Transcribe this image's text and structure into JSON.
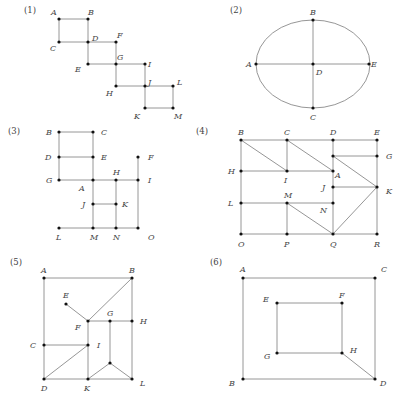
{
  "figures": [
    {
      "label": "(1)",
      "label_pos": [
        24,
        13
      ],
      "points": {
        "A": {
          "x": 59,
          "y": 19,
          "lx": 51,
          "ly": 15
        },
        "B": {
          "x": 88,
          "y": 19,
          "lx": 88,
          "ly": 15
        },
        "C": {
          "x": 59,
          "y": 42,
          "lx": 50,
          "ly": 51
        },
        "D": {
          "x": 88,
          "y": 42,
          "lx": 92,
          "ly": 41
        },
        "F": {
          "x": 116,
          "y": 42,
          "lx": 117,
          "ly": 38
        },
        "E": {
          "x": 88,
          "y": 64,
          "lx": 75,
          "ly": 72
        },
        "G": {
          "x": 116,
          "y": 64,
          "lx": 117,
          "ly": 60
        },
        "I": {
          "x": 145,
          "y": 64,
          "lx": 148,
          "ly": 67
        },
        "H": {
          "x": 116,
          "y": 86,
          "lx": 106,
          "ly": 96
        },
        "J": {
          "x": 145,
          "y": 86,
          "lx": 148,
          "ly": 85
        },
        "L": {
          "x": 173,
          "y": 86,
          "lx": 177,
          "ly": 85
        },
        "K": {
          "x": 145,
          "y": 108,
          "lx": 134,
          "ly": 119
        },
        "M": {
          "x": 173,
          "y": 108,
          "lx": 174,
          "ly": 119
        }
      },
      "edges": [
        [
          "A",
          "B"
        ],
        [
          "A",
          "C"
        ],
        [
          "B",
          "D"
        ],
        [
          "C",
          "D"
        ],
        [
          "D",
          "F"
        ],
        [
          "D",
          "E"
        ],
        [
          "F",
          "G"
        ],
        [
          "E",
          "G"
        ],
        [
          "G",
          "I"
        ],
        [
          "G",
          "H"
        ],
        [
          "H",
          "J"
        ],
        [
          "I",
          "J"
        ],
        [
          "J",
          "L"
        ],
        [
          "J",
          "K"
        ],
        [
          "L",
          "M"
        ],
        [
          "K",
          "M"
        ]
      ]
    },
    {
      "label": "(2)",
      "label_pos": [
        230,
        13
      ],
      "ellipse": {
        "cx": 313,
        "cy": 64,
        "rx": 57,
        "ry": 44
      },
      "points": {
        "B": {
          "x": 313,
          "y": 20,
          "lx": 310,
          "ly": 15
        },
        "A": {
          "x": 256,
          "y": 64,
          "lx": 246,
          "ly": 67
        },
        "D": {
          "x": 313,
          "y": 64,
          "lx": 316,
          "ly": 75
        },
        "E": {
          "x": 369,
          "y": 64,
          "lx": 371,
          "ly": 67
        },
        "C": {
          "x": 313,
          "y": 108,
          "lx": 310,
          "ly": 120
        }
      },
      "edges": [
        [
          "A",
          "E"
        ],
        [
          "B",
          "C"
        ]
      ]
    },
    {
      "label": "(3)",
      "label_pos": [
        8,
        134
      ],
      "points": {
        "B": {
          "x": 59,
          "y": 132,
          "lx": 46,
          "ly": 135
        },
        "C": {
          "x": 93,
          "y": 132,
          "lx": 101,
          "ly": 135
        },
        "D": {
          "x": 59,
          "y": 157,
          "lx": 45,
          "ly": 160
        },
        "E": {
          "x": 93,
          "y": 157,
          "lx": 101,
          "ly": 160
        },
        "F": {
          "x": 138,
          "y": 157,
          "lx": 148,
          "ly": 160
        },
        "G": {
          "x": 59,
          "y": 180,
          "lx": 46,
          "ly": 183
        },
        "A": {
          "x": 93,
          "y": 180,
          "lx": 79,
          "ly": 191
        },
        "H": {
          "x": 116,
          "y": 180,
          "lx": 113,
          "ly": 175
        },
        "I": {
          "x": 138,
          "y": 180,
          "lx": 148,
          "ly": 183
        },
        "J": {
          "x": 93,
          "y": 204,
          "lx": 82,
          "ly": 207
        },
        "K": {
          "x": 116,
          "y": 204,
          "lx": 122,
          "ly": 207
        },
        "L": {
          "x": 59,
          "y": 228,
          "lx": 56,
          "ly": 240
        },
        "M": {
          "x": 93,
          "y": 228,
          "lx": 90,
          "ly": 240
        },
        "N": {
          "x": 116,
          "y": 228,
          "lx": 113,
          "ly": 240
        },
        "O": {
          "x": 138,
          "y": 228,
          "lx": 148,
          "ly": 240
        }
      },
      "edges": [
        [
          "B",
          "C"
        ],
        [
          "B",
          "D"
        ],
        [
          "D",
          "E"
        ],
        [
          "C",
          "E"
        ],
        [
          "D",
          "G"
        ],
        [
          "G",
          "A"
        ],
        [
          "E",
          "A"
        ],
        [
          "A",
          "H"
        ],
        [
          "H",
          "I"
        ],
        [
          "F",
          "I"
        ],
        [
          "A",
          "J"
        ],
        [
          "J",
          "K"
        ],
        [
          "H",
          "K"
        ],
        [
          "K",
          "N"
        ],
        [
          "J",
          "M"
        ],
        [
          "L",
          "M"
        ],
        [
          "M",
          "N"
        ],
        [
          "N",
          "O"
        ],
        [
          "I",
          "O"
        ]
      ]
    },
    {
      "label": "(4)",
      "label_pos": [
        196,
        134
      ],
      "points": {
        "B": {
          "x": 241,
          "y": 140,
          "lx": 238,
          "ly": 135
        },
        "C": {
          "x": 287,
          "y": 140,
          "lx": 284,
          "ly": 135
        },
        "D": {
          "x": 333,
          "y": 140,
          "lx": 330,
          "ly": 135
        },
        "E": {
          "x": 377,
          "y": 140,
          "lx": 374,
          "ly": 135
        },
        "D2": {
          "x": 333,
          "y": 156,
          "lx": null,
          "ly": null
        },
        "G": {
          "x": 377,
          "y": 156,
          "lx": 386,
          "ly": 159
        },
        "H": {
          "x": 241,
          "y": 171,
          "lx": 228,
          "ly": 174
        },
        "I": {
          "x": 287,
          "y": 171,
          "lx": 284,
          "ly": 183
        },
        "A": {
          "x": 333,
          "y": 171,
          "lx": 335,
          "ly": 178
        },
        "J": {
          "x": 333,
          "y": 187,
          "lx": 322,
          "ly": 190
        },
        "K": {
          "x": 377,
          "y": 187,
          "lx": 386,
          "ly": 194
        },
        "L": {
          "x": 241,
          "y": 203,
          "lx": 228,
          "ly": 206
        },
        "M": {
          "x": 287,
          "y": 203,
          "lx": 284,
          "ly": 198
        },
        "N": {
          "x": 333,
          "y": 203,
          "lx": 320,
          "ly": 213
        },
        "O": {
          "x": 241,
          "y": 234,
          "lx": 238,
          "ly": 247
        },
        "P": {
          "x": 287,
          "y": 234,
          "lx": 284,
          "ly": 247
        },
        "Q": {
          "x": 333,
          "y": 234,
          "lx": 330,
          "ly": 247
        },
        "R": {
          "x": 377,
          "y": 234,
          "lx": 374,
          "ly": 247
        }
      },
      "edges": [
        [
          "B",
          "C"
        ],
        [
          "C",
          "D"
        ],
        [
          "D",
          "E"
        ],
        [
          "B",
          "H"
        ],
        [
          "H",
          "L"
        ],
        [
          "L",
          "O"
        ],
        [
          "O",
          "P"
        ],
        [
          "P",
          "Q"
        ],
        [
          "Q",
          "R"
        ],
        [
          "E",
          "G"
        ],
        [
          "G",
          "K"
        ],
        [
          "K",
          "R"
        ],
        [
          "B",
          "I"
        ],
        [
          "C",
          "I"
        ],
        [
          "H",
          "I"
        ],
        [
          "I",
          "A"
        ],
        [
          "C",
          "A"
        ],
        [
          "D",
          "D2"
        ],
        [
          "D2",
          "A"
        ],
        [
          "A",
          "J"
        ],
        [
          "J",
          "N"
        ],
        [
          "N",
          "Q"
        ],
        [
          "D2",
          "G"
        ],
        [
          "D2",
          "K"
        ],
        [
          "J",
          "K"
        ],
        [
          "L",
          "M"
        ],
        [
          "M",
          "N"
        ],
        [
          "M",
          "P"
        ],
        [
          "M",
          "Q"
        ],
        [
          "Q",
          "K"
        ]
      ]
    },
    {
      "label": "(5)",
      "label_pos": [
        10,
        265
      ],
      "points": {
        "A": {
          "x": 44,
          "y": 278,
          "lx": 41,
          "ly": 273
        },
        "B": {
          "x": 132,
          "y": 278,
          "lx": 129,
          "ly": 273
        },
        "E": {
          "x": 66,
          "y": 304,
          "lx": 63,
          "ly": 298
        },
        "F": {
          "x": 88,
          "y": 321,
          "lx": 75,
          "ly": 330
        },
        "G": {
          "x": 110,
          "y": 321,
          "lx": 107,
          "ly": 316
        },
        "H": {
          "x": 132,
          "y": 321,
          "lx": 140,
          "ly": 324
        },
        "C": {
          "x": 44,
          "y": 345,
          "lx": 30,
          "ly": 348
        },
        "I": {
          "x": 88,
          "y": 345,
          "lx": 97,
          "ly": 348
        },
        "P": {
          "x": 110,
          "y": 363,
          "lx": null,
          "ly": null
        },
        "D": {
          "x": 44,
          "y": 379,
          "lx": 41,
          "ly": 391
        },
        "K": {
          "x": 88,
          "y": 379,
          "lx": 84,
          "ly": 391
        },
        "L": {
          "x": 132,
          "y": 379,
          "lx": 140,
          "ly": 386
        }
      },
      "edges": [
        [
          "A",
          "B"
        ],
        [
          "A",
          "C"
        ],
        [
          "C",
          "D"
        ],
        [
          "B",
          "H"
        ],
        [
          "H",
          "L"
        ],
        [
          "D",
          "K"
        ],
        [
          "K",
          "L"
        ],
        [
          "B",
          "F"
        ],
        [
          "E",
          "F"
        ],
        [
          "F",
          "G"
        ],
        [
          "G",
          "H"
        ],
        [
          "F",
          "I"
        ],
        [
          "C",
          "I"
        ],
        [
          "I",
          "K"
        ],
        [
          "D",
          "I"
        ],
        [
          "G",
          "P"
        ],
        [
          "P",
          "K"
        ],
        [
          "P",
          "L"
        ]
      ]
    },
    {
      "label": "(6)",
      "label_pos": [
        210,
        265
      ],
      "points": {
        "A": {
          "x": 243,
          "y": 278,
          "lx": 240,
          "ly": 272
        },
        "C": {
          "x": 375,
          "y": 278,
          "lx": 381,
          "ly": 272
        },
        "E": {
          "x": 277,
          "y": 303,
          "lx": 263,
          "ly": 302
        },
        "F": {
          "x": 342,
          "y": 303,
          "lx": 339,
          "ly": 298
        },
        "G": {
          "x": 277,
          "y": 353,
          "lx": 264,
          "ly": 359
        },
        "H": {
          "x": 342,
          "y": 353,
          "lx": 350,
          "ly": 353
        },
        "B": {
          "x": 243,
          "y": 379,
          "lx": 229,
          "ly": 386
        },
        "D": {
          "x": 375,
          "y": 379,
          "lx": 380,
          "ly": 386
        }
      },
      "edges": [
        [
          "A",
          "C"
        ],
        [
          "A",
          "B"
        ],
        [
          "C",
          "D"
        ],
        [
          "B",
          "D"
        ],
        [
          "E",
          "F"
        ],
        [
          "E",
          "G"
        ],
        [
          "F",
          "H"
        ],
        [
          "G",
          "H"
        ],
        [
          "H",
          "D"
        ]
      ]
    }
  ]
}
